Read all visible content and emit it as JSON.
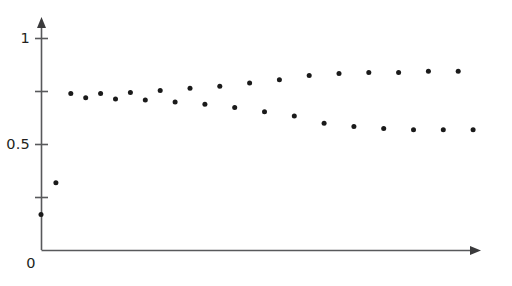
{
  "figure": {
    "width": 512,
    "height": 286,
    "background": "#ffffff",
    "dot_color": "#1a1a1a",
    "axis_color": "#58595b",
    "text_color": "#231f20"
  },
  "axes": {
    "y_ticks_labeled": [
      {
        "value": 1,
        "label": "1"
      },
      {
        "value": 0.5,
        "label": "0.5"
      }
    ],
    "y_ticks_unlabeled": [
      0.75,
      0.25
    ],
    "origin_label": "0",
    "x_axis_has_arrow": true,
    "y_axis_has_arrow": true,
    "x_ticks": [],
    "x_tick_labels": []
  },
  "chart_data": {
    "type": "scatter",
    "title": "",
    "xlabel": "",
    "ylabel": "",
    "xlim": [
      0,
      31
    ],
    "ylim": [
      0,
      1.1
    ],
    "grid": false,
    "legend": false,
    "legend_position": "none",
    "marker": "circle",
    "marker_size_px": 5,
    "series": [
      {
        "name": "iterates",
        "x": [
          0,
          1,
          2,
          3,
          4,
          5,
          6,
          7,
          8,
          9,
          10,
          11,
          12,
          13,
          14,
          15,
          16,
          17,
          18,
          19,
          20,
          21,
          22,
          23,
          24,
          25,
          26,
          27,
          28,
          29
        ],
        "values": [
          0.17,
          0.32,
          0.74,
          0.72,
          0.74,
          0.715,
          0.745,
          0.71,
          0.755,
          0.7,
          0.765,
          0.69,
          0.775,
          0.675,
          0.79,
          0.655,
          0.805,
          0.635,
          0.825,
          0.6,
          0.835,
          0.585,
          0.84,
          0.575,
          0.84,
          0.57,
          0.845,
          0.57,
          0.845,
          0.57
        ]
      }
    ],
    "annotations": [
      "Initial transient rises from 0.17 to 0.32",
      "Oscillation about 0.73 with growing amplitude",
      "Settles into a stable period-2 cycle between 0.845 and 0.57"
    ]
  }
}
